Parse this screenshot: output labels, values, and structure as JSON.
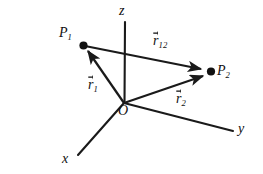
{
  "figure": {
    "background_color": "#ffffff",
    "stroke_color": "#1a1a1a",
    "width": 263,
    "height": 174
  },
  "axes": [
    {
      "name": "z",
      "label": "z",
      "from": [
        124,
        103
      ],
      "to": [
        125,
        22
      ]
    },
    {
      "name": "y",
      "label": "y",
      "from": [
        124,
        103
      ],
      "to": [
        233,
        131
      ]
    },
    {
      "name": "x",
      "label": "x",
      "from": [
        124,
        103
      ],
      "to": [
        78,
        155
      ]
    }
  ],
  "origin": {
    "label": "O",
    "point": [
      124,
      103
    ]
  },
  "points": [
    {
      "name": "P1",
      "base": "P",
      "sub": "1",
      "at": [
        83,
        45
      ]
    },
    {
      "name": "P2",
      "base": "P",
      "sub": "2",
      "at": [
        211,
        72
      ]
    }
  ],
  "vectors": [
    {
      "name": "r1",
      "base": "r",
      "sub": "1",
      "label_text": "r1",
      "from": [
        124,
        103
      ],
      "to": [
        86,
        48
      ],
      "description": "position vector from origin O to point P1"
    },
    {
      "name": "r2",
      "base": "r",
      "sub": "2",
      "label_text": "r2",
      "from": [
        124,
        103
      ],
      "to": [
        207,
        75
      ],
      "description": "position vector from origin O to point P2"
    },
    {
      "name": "r12",
      "base": "r",
      "sub": "12",
      "label_text": "r12",
      "from": [
        85,
        46
      ],
      "to": [
        206,
        70
      ],
      "description": "separation vector from point P1 to point P2"
    }
  ],
  "labels": {
    "z_axis": "z",
    "y_axis": "y",
    "x_axis": "x",
    "origin": "O",
    "point_1_base": "P",
    "point_1_sub": "1",
    "point_2_base": "P",
    "point_2_sub": "2",
    "vector_r1_base": "r",
    "vector_r1_sub": "1",
    "vector_r2_base": "r",
    "vector_r2_sub": "2",
    "vector_r12_base": "r",
    "vector_r12_sub": "12"
  }
}
